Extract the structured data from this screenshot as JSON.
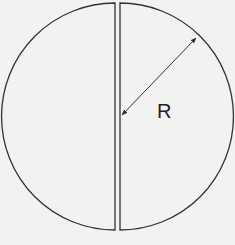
{
  "diagram": {
    "radius_label": "R",
    "colors": {
      "stroke": "#333333",
      "background": "#f2f2f0"
    }
  }
}
